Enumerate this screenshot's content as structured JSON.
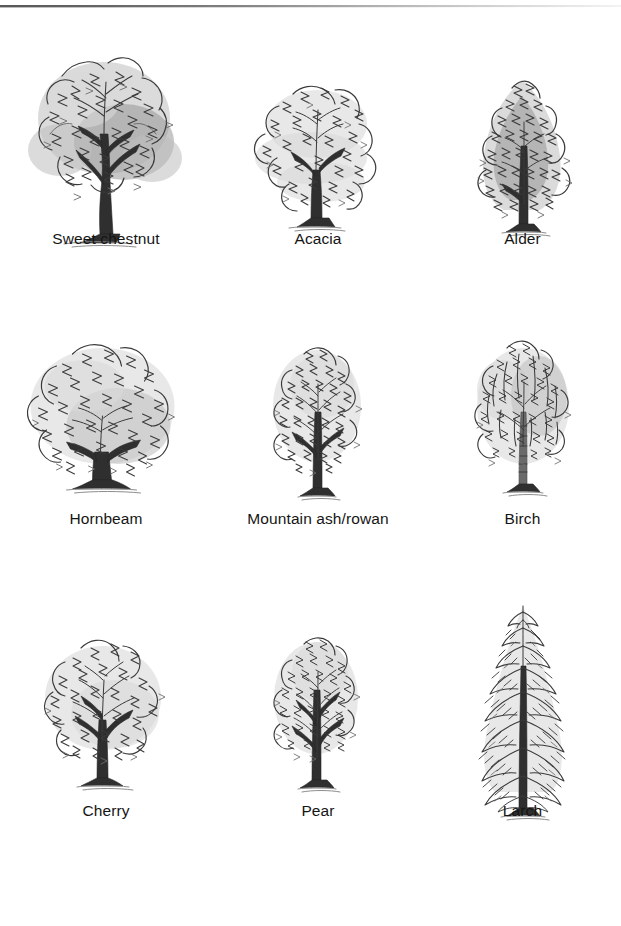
{
  "page": {
    "background_color": "#ffffff",
    "ink_color": "#3a3a3a",
    "label_color": "#151515",
    "top_rule": "horizontal-scan-rule"
  },
  "plate": {
    "columns": 3,
    "rows": 3,
    "rows_data": [
      {
        "row_index": 1,
        "trees": [
          {
            "label": "Sweet chestnut",
            "icon": "broadleaf-spreading-tree-icon",
            "form": "broad spreading crown, dark heavy foliage, stout furrowed trunk"
          },
          {
            "label": "Acacia",
            "icon": "broadleaf-layered-tree-icon",
            "form": "light feathery crown in horizontal tiers, slender trunk"
          },
          {
            "label": "Alder",
            "icon": "broadleaf-conical-tree-icon",
            "form": "narrow dense dark conical crown, straight central trunk"
          }
        ]
      },
      {
        "row_index": 2,
        "trees": [
          {
            "label": "Hornbeam",
            "icon": "broadleaf-domed-tree-icon",
            "form": "rounded dome crown, short stout trunk"
          },
          {
            "label": "Mountain ash/rowan",
            "icon": "broadleaf-oval-tree-icon",
            "form": "upright oval open crown, visible branching"
          },
          {
            "label": "Birch",
            "icon": "broadleaf-weeping-tree-icon",
            "form": "drooping weeping crown, slender pale marked trunk"
          }
        ]
      },
      {
        "row_index": 3,
        "trees": [
          {
            "label": "Cherry",
            "icon": "broadleaf-round-open-tree-icon",
            "form": "rounded open crown, dark slender trunk with branches"
          },
          {
            "label": "Pear",
            "icon": "broadleaf-upright-tree-icon",
            "form": "narrow upright crown with central leader"
          },
          {
            "label": "Larch",
            "icon": "conifer-tree-icon",
            "form": "tall narrow conifer, tiered drooping branches, straight trunk"
          }
        ]
      }
    ]
  }
}
